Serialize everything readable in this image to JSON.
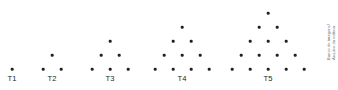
{
  "figure": {
    "background_color": "#ffffff",
    "dot_color": "#231f20",
    "label_color": "#231f20",
    "credit_color": "#6d6e71",
    "credit_line_1": "Banco de imagens/",
    "credit_line_2": "Arquivo da editora",
    "terms": [
      {
        "label": "T1",
        "dot_count": 1,
        "rows": [
          1
        ],
        "label_x": 12,
        "label_y": 74,
        "apex_x": 12,
        "base_y": 69,
        "row_gap": 14,
        "col_gap": 18
      },
      {
        "label": "T2",
        "dot_count": 3,
        "rows": [
          1,
          2
        ],
        "label_x": 52,
        "label_y": 74,
        "apex_x": 52,
        "base_y": 69,
        "row_gap": 14,
        "col_gap": 18
      },
      {
        "label": "T3",
        "dot_count": 6,
        "rows": [
          1,
          2,
          3
        ],
        "label_x": 110,
        "label_y": 74,
        "apex_x": 110,
        "base_y": 69,
        "row_gap": 14,
        "col_gap": 18
      },
      {
        "label": "T4",
        "dot_count": 10,
        "rows": [
          1,
          2,
          3,
          4
        ],
        "label_x": 182,
        "label_y": 74,
        "apex_x": 182,
        "base_y": 69,
        "row_gap": 14,
        "col_gap": 18
      },
      {
        "label": "T5",
        "dot_count": 15,
        "rows": [
          1,
          2,
          3,
          4,
          5
        ],
        "label_x": 268,
        "label_y": 74,
        "apex_x": 268,
        "base_y": 69,
        "row_gap": 14,
        "col_gap": 18
      }
    ]
  },
  "chart_data": {
    "type": "scatter",
    "title": "",
    "subtitle": "",
    "xlabel": "",
    "ylabel": "",
    "grid": false,
    "legend": null,
    "categories": [
      "T1",
      "T2",
      "T3",
      "T4",
      "T5"
    ],
    "values": [
      1,
      3,
      6,
      10,
      15
    ],
    "series": [
      {
        "name": "Dots per term",
        "values": [
          1,
          3,
          6,
          10,
          15
        ]
      },
      {
        "name": "Rows per term",
        "values": [
          1,
          2,
          3,
          4,
          5
        ]
      }
    ],
    "row_structure": [
      [
        1
      ],
      [
        1,
        2
      ],
      [
        1,
        2,
        3
      ],
      [
        1,
        2,
        3,
        4
      ],
      [
        1,
        2,
        3,
        4,
        5
      ]
    ]
  }
}
